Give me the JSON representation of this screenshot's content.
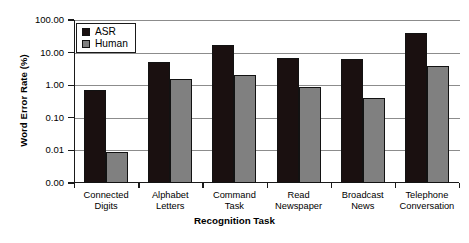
{
  "chart_data": {
    "type": "bar",
    "title": "",
    "xlabel": "Recognition Task",
    "ylabel": "Word Error Rate (%)",
    "yscale": "log",
    "ylim": [
      0.001,
      100
    ],
    "grid": true,
    "legend_position": "top-left",
    "categories": [
      "Connected Digits",
      "Alphabet Letters",
      "Command Task",
      "Read Newspaper",
      "Broadcast News",
      "Telephone Conversation"
    ],
    "category_lines": [
      [
        "Connected",
        "Digits"
      ],
      [
        "Alphabet",
        "Letters"
      ],
      [
        "Command",
        "Task"
      ],
      [
        "Read",
        "Newspaper"
      ],
      [
        "Broadcast",
        "News"
      ],
      [
        "Telephone",
        "Conversation"
      ]
    ],
    "series": [
      {
        "name": "ASR",
        "color": "#1a1010",
        "values": [
          0.7,
          5.0,
          17.0,
          7.0,
          6.5,
          40.0
        ]
      },
      {
        "name": "Human",
        "color": "#808080",
        "values": [
          0.009,
          1.6,
          2.0,
          0.9,
          0.4,
          4.0
        ]
      }
    ],
    "ytick_labels": [
      "100.00",
      "10.00",
      "1.00",
      "0.10",
      "0.01",
      "0.00"
    ],
    "ytick_values": [
      100,
      10,
      1,
      0.1,
      0.01,
      0
    ]
  }
}
